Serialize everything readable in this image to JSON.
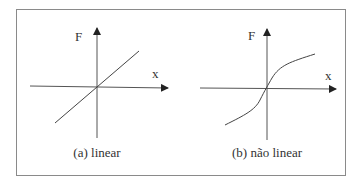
{
  "figure": {
    "panels": [
      {
        "id": "a",
        "caption": "(a) linear",
        "y_label": "F",
        "x_label": "x",
        "curve": "linear"
      },
      {
        "id": "b",
        "caption": "(b) não linear",
        "y_label": "F",
        "x_label": "x",
        "curve": "nonlinear-sigmoid"
      }
    ]
  },
  "colors": {
    "line": "#444444",
    "frame": "#8a8a8a",
    "text": "#333333"
  }
}
